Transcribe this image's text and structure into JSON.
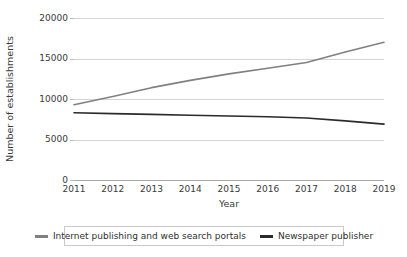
{
  "chart_data": {
    "type": "line",
    "title": "",
    "xlabel": "Year",
    "ylabel": "Number of establishments",
    "x": [
      2011,
      2012,
      2013,
      2014,
      2015,
      2016,
      2017,
      2018,
      2019
    ],
    "xtick_labels": [
      "2011",
      "2012",
      "2013",
      "2014",
      "2015",
      "2016",
      "2017",
      "2018",
      "2019"
    ],
    "ytick_labels": [
      "0",
      "5000",
      "10000",
      "15000",
      "20000"
    ],
    "yticks": [
      0,
      5000,
      10000,
      15000,
      20000
    ],
    "ylim": [
      0,
      20000
    ],
    "xlim": [
      2011,
      2019
    ],
    "grid": "horizontal",
    "legend_position": "bottom",
    "series": [
      {
        "name": "Internet publishing and web search portals",
        "color": "#808080",
        "values": [
          9300,
          10300,
          11400,
          12300,
          13100,
          13800,
          14500,
          15800,
          17000
        ]
      },
      {
        "name": "Newspaper publisher",
        "color": "#2b2b2b",
        "values": [
          8300,
          8200,
          8100,
          8000,
          7900,
          7800,
          7650,
          7300,
          6900
        ]
      }
    ]
  },
  "legend": {
    "entries": [
      {
        "label": "Internet publishing and web search portals",
        "color": "#808080"
      },
      {
        "label": "Newspaper publisher",
        "color": "#2b2b2b"
      }
    ]
  },
  "axes": {
    "y_title": "Number of establishments",
    "x_title": "Year"
  }
}
